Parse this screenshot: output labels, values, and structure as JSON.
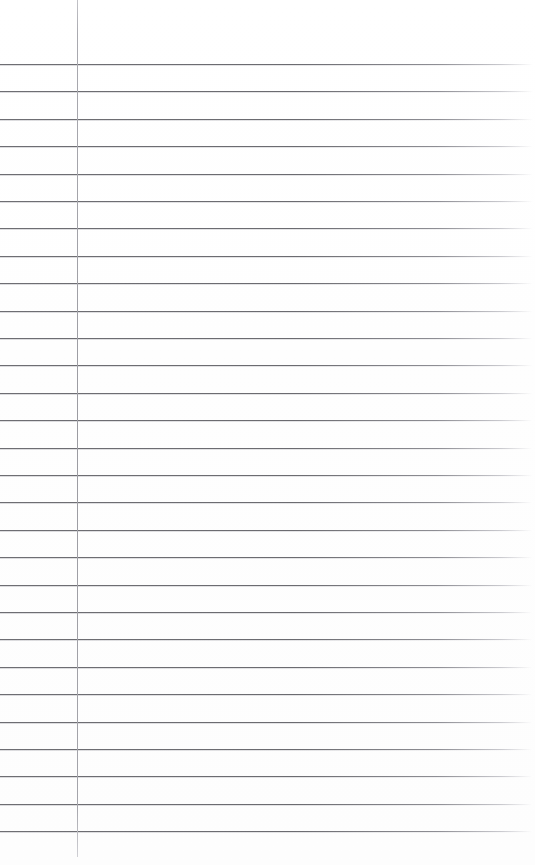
{
  "page": {
    "kind": "lined-notebook-page",
    "width": 535,
    "height": 865,
    "background_color": "#ffffff",
    "text_content": "",
    "has_text": false
  },
  "ruling": {
    "horizontal_rule_color": "#6e6e73",
    "horizontal_rule_thickness": 1,
    "horizontal_rule_left": 0,
    "horizontal_rule_right": 533,
    "first_rule_y": 64,
    "line_spacing": 27.4,
    "line_count": 28,
    "rule_y_positions": [
      64,
      91,
      119,
      146,
      174,
      201,
      228,
      256,
      283,
      311,
      338,
      365,
      393,
      420,
      448,
      475,
      502,
      530,
      557,
      585,
      612,
      639,
      667,
      694,
      722,
      749,
      776,
      804,
      831
    ]
  },
  "margin": {
    "vertical_rule_color": "#9b9ba1",
    "vertical_rule_thickness": 1,
    "vertical_rule_x": 77,
    "vertical_rule_top": 0,
    "vertical_rule_bottom": 857
  }
}
